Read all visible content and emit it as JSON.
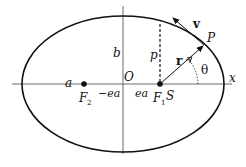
{
  "diagram": {
    "labels": {
      "x_axis": "x",
      "origin": "O",
      "semi_major": "a",
      "semi_minor": "b",
      "semi_latus_rectum": "p",
      "neg_focus_distance": "−ea",
      "pos_focus_distance": "ea",
      "focus2": "F",
      "focus2_sub": "2",
      "focus1": "F",
      "focus1_sub": "1",
      "sun": "S",
      "planet": "P",
      "radius_vector": "r",
      "velocity": "v",
      "angle": "θ"
    },
    "colors": {
      "stroke": "#111111",
      "axis": "#444444",
      "background": "#ffffff"
    },
    "geometry": {
      "center": [
        123,
        84
      ],
      "rx": 101,
      "ry": 68,
      "focus1": [
        160,
        84
      ],
      "focus2": [
        84,
        84
      ],
      "planet": [
        204,
        45
      ]
    }
  }
}
